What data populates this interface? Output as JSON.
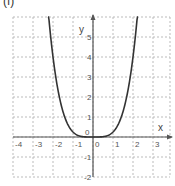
{
  "figure_label": "(f)",
  "chart_data": {
    "type": "line",
    "title": "",
    "function": "y = x^4 / 4",
    "xlabel": "x",
    "ylabel": "y",
    "xlim": [
      -4.0,
      3.85
    ],
    "ylim": [
      -2.0,
      6.0
    ],
    "grid": true,
    "grid_style": "dotted",
    "x_ticks": [
      -4,
      -3,
      -2,
      -1,
      0,
      1,
      2,
      3
    ],
    "x_tick_labels": [
      "-4",
      "-3",
      "-2",
      "-1",
      "0",
      "1",
      "2",
      "3"
    ],
    "y_ticks": [
      -2,
      -1,
      0,
      1,
      2,
      3,
      4,
      5
    ],
    "y_tick_labels": [
      "-2",
      "-1",
      "0",
      "1",
      "2",
      "3",
      "4",
      "5"
    ],
    "series": [
      {
        "name": "f(x)",
        "x": [
          -2.2,
          -2.0,
          -1.8,
          -1.6,
          -1.4,
          -1.2,
          -1.0,
          -0.8,
          -0.6,
          -0.4,
          -0.2,
          0.0,
          0.2,
          0.4,
          0.6,
          0.8,
          1.0,
          1.2,
          1.4,
          1.6,
          1.8,
          2.0,
          2.2
        ],
        "y": [
          5.86,
          4.0,
          2.62,
          1.64,
          0.96,
          0.52,
          0.25,
          0.1,
          0.03,
          0.01,
          0.0,
          0.0,
          0.0,
          0.01,
          0.03,
          0.1,
          0.25,
          0.52,
          0.96,
          1.64,
          2.62,
          4.0,
          5.86
        ]
      }
    ],
    "colors": {
      "curve": "#333333",
      "axis": "#555555",
      "grid": "#bbbbbb"
    }
  }
}
